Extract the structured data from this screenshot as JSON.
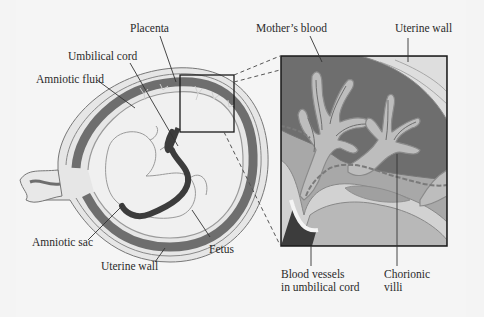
{
  "diagram": {
    "labels": {
      "placenta": "Placenta",
      "umbilical_cord": "Umbilical cord",
      "amniotic_fluid": "Amniotic fluid",
      "mothers_blood": "Mother’s blood",
      "uterine_wall_top": "Uterine wall",
      "amniotic_sac": "Amniotic sac",
      "uterine_wall_bottom": "Uterine wall",
      "fetus": "Fetus",
      "blood_vessels_line1": "Blood vessels",
      "blood_vessels_line2": "in umbilical cord",
      "chorionic_line1": "Chorionic",
      "chorionic_line2": "villi"
    },
    "colors": {
      "background": "#f4f4f4",
      "maternal_blood": "#6e6e6e",
      "villi_fill": "#bdbdbd",
      "villi_outline": "#8a8a8a",
      "tissue_light": "#d2d2d2",
      "tissue_mid": "#a8a8a8",
      "cord_dark": "#3c3c3c",
      "outline": "#1a1a1a"
    }
  }
}
